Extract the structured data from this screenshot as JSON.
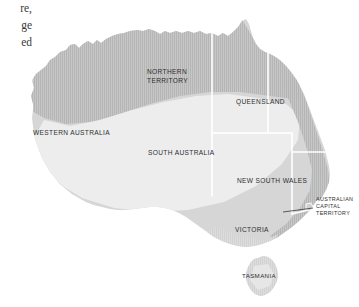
{
  "page": {
    "background_color": "#ffffff",
    "width": 359,
    "height": 307
  },
  "text_column": {
    "fragments": [
      "re,",
      "ge",
      "ed"
    ]
  },
  "map": {
    "title": "Australia",
    "land_fill": "#d9d9d9",
    "interior_fill": "#ececec",
    "coastal_band_fill": "#bdbdbd",
    "border_color": "#ffffff",
    "ocean_color": "#ffffff",
    "labels": [
      {
        "id": "northern-territory",
        "text_lines": [
          "NORTHERN",
          "TERRITORY"
        ],
        "x": 147,
        "y": 72
      },
      {
        "id": "queensland",
        "text_lines": [
          "QUEENSLAND"
        ],
        "x": 236,
        "y": 101
      },
      {
        "id": "western-australia",
        "text_lines": [
          "WESTERN AUSTRALIA"
        ],
        "x": 33,
        "y": 132
      },
      {
        "id": "south-australia",
        "text_lines": [
          "SOUTH AUSTRALIA"
        ],
        "x": 148,
        "y": 152
      },
      {
        "id": "new-south-wales",
        "text_lines": [
          "NEW SOUTH WALES"
        ],
        "x": 237,
        "y": 180
      },
      {
        "id": "australian-capital-territory",
        "text_lines": [
          "AUSTRALIAN",
          "CAPITAL",
          "TERRITORY"
        ],
        "x": 316,
        "y": 199
      },
      {
        "id": "victoria",
        "text_lines": [
          "VICTORIA"
        ],
        "x": 235,
        "y": 229
      },
      {
        "id": "tasmania",
        "text_lines": [
          "TASMANIA"
        ],
        "x": 256,
        "y": 275
      }
    ],
    "leader_line": {
      "id": "act-leader-line",
      "x1": 283,
      "y1": 212,
      "x2": 313,
      "y2": 208
    }
  }
}
